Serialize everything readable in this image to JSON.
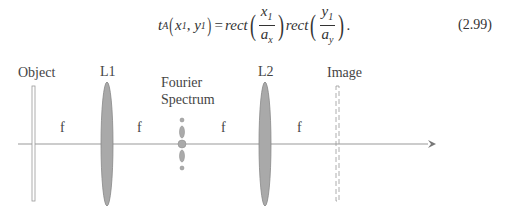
{
  "equation": {
    "lhs_func": "t",
    "lhs_sub": "A",
    "lhs_args": [
      "x",
      "1",
      "y",
      "1"
    ],
    "equals": "=",
    "rect1": "rect",
    "frac1_num": "x",
    "frac1_num_sub": "1",
    "frac1_den": "a",
    "frac1_den_sub": "x",
    "rect2": "rect",
    "frac2_num": "y",
    "frac2_num_sub": "1",
    "frac2_den": "a",
    "frac2_den_sub": "y",
    "trailing": ".",
    "number": "(2.99)"
  },
  "diagram": {
    "labels": {
      "object": "Object",
      "l1": "L1",
      "fourier_line1": "Fourier",
      "fourier_line2": "Spectrum",
      "l2": "L2",
      "image": "Image"
    },
    "focal_labels": [
      "f",
      "f",
      "f",
      "f"
    ],
    "colors": {
      "axis": "#888888",
      "lens_fill": "#a9a9a9",
      "lens_stroke": "#777777",
      "text": "#444444"
    }
  }
}
